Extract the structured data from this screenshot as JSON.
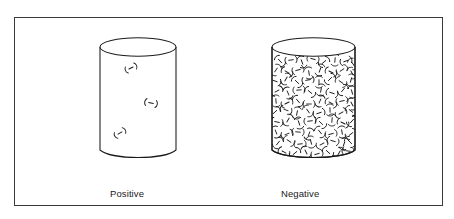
{
  "figure": {
    "title": "",
    "background_color": "#ffffff",
    "frame": {
      "name": "figure-border",
      "color": "#3a3a3e",
      "x": 14,
      "y": 17,
      "width": 429,
      "height": 189
    },
    "ink_color": "#1a1a1a"
  },
  "diagram": {
    "type": "schematic-illustration",
    "objects": [
      {
        "id": "positive-cylinder",
        "name": "positive-charge-cylinder",
        "shape": "cylinder",
        "x": 100,
        "y": 38,
        "width": 76,
        "height": 122,
        "top_ellipse_ry": 9,
        "charge_symbol": "(–)",
        "charge_symbol_label": "minus-sign-in-parentheses",
        "charge_count": 3,
        "charge_density": "sparse",
        "charges": [
          {
            "x": 131,
            "y": 68,
            "rotation": -25,
            "scale": 1.0
          },
          {
            "x": 151,
            "y": 103,
            "rotation": 10,
            "scale": 1.05
          },
          {
            "x": 120,
            "y": 133,
            "rotation": -30,
            "scale": 1.0
          }
        ],
        "caption": {
          "line1": "Positive",
          "line2": "charge"
        }
      },
      {
        "id": "negative-cylinder",
        "name": "negative-charge-cylinder",
        "shape": "cylinder",
        "x": 272,
        "y": 38,
        "width": 83,
        "height": 122,
        "top_ellipse_ry": 9,
        "charge_symbol": "(–)",
        "charge_symbol_label": "minus-sign-in-parentheses",
        "charge_count": 96,
        "charge_density": "dense",
        "fill_grid": {
          "columns": 8,
          "rows": 12
        },
        "caption": {
          "line1": "Negative",
          "line2": "charge"
        }
      }
    ]
  },
  "captions": {
    "positive": {
      "line1": "Positive",
      "line2": "charge"
    },
    "negative": {
      "line1": "Negative",
      "line2": "charge"
    }
  }
}
